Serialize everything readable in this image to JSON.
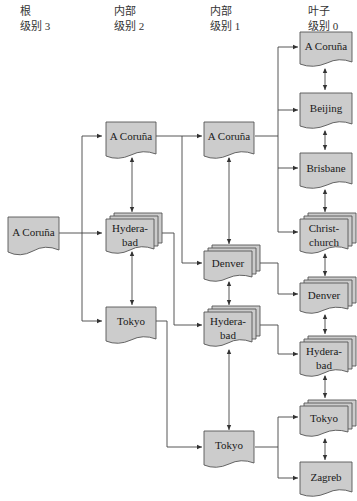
{
  "headers": [
    {
      "line1": "根",
      "line2": "级别 3",
      "x": 20
    },
    {
      "line1": "内部",
      "line2": "级别 2",
      "x": 114
    },
    {
      "line1": "内部",
      "line2": "级别 1",
      "x": 210
    },
    {
      "line1": "叶子",
      "line2": "级别 0",
      "x": 308
    }
  ],
  "colors": {
    "box_fill": "#cccccc",
    "box_stroke": "#555555",
    "line": "#444444"
  },
  "nodes": {
    "root": {
      "label": "A Coruña",
      "level": 3
    },
    "l2_acoruna": {
      "label": "A Coruña",
      "level": 2
    },
    "l2_hyderabad": {
      "label1": "Hydera-",
      "label2": "bad",
      "level": 2
    },
    "l2_tokyo": {
      "label": "Tokyo",
      "level": 2
    },
    "l1_acoruna": {
      "label": "A Coruña",
      "level": 1
    },
    "l1_denver": {
      "label": "Denver",
      "level": 1
    },
    "l1_hyderabad": {
      "label1": "Hydera-",
      "label2": "bad",
      "level": 1
    },
    "l1_tokyo": {
      "label": "Tokyo",
      "level": 1
    },
    "l0_acoruna": {
      "label": "A Coruña",
      "level": 0
    },
    "l0_beijing": {
      "label": "Beijing",
      "level": 0
    },
    "l0_brisbane": {
      "label": "Brisbane",
      "level": 0
    },
    "l0_christchurch": {
      "label1": "Christ-",
      "label2": "church",
      "level": 0
    },
    "l0_denver": {
      "label": "Denver",
      "level": 0
    },
    "l0_hyderabad": {
      "label1": "Hydera-",
      "label2": "bad",
      "level": 0
    },
    "l0_tokyo": {
      "label": "Tokyo",
      "level": 0
    },
    "l0_zagreb": {
      "label": "Zagreb",
      "level": 0
    }
  }
}
